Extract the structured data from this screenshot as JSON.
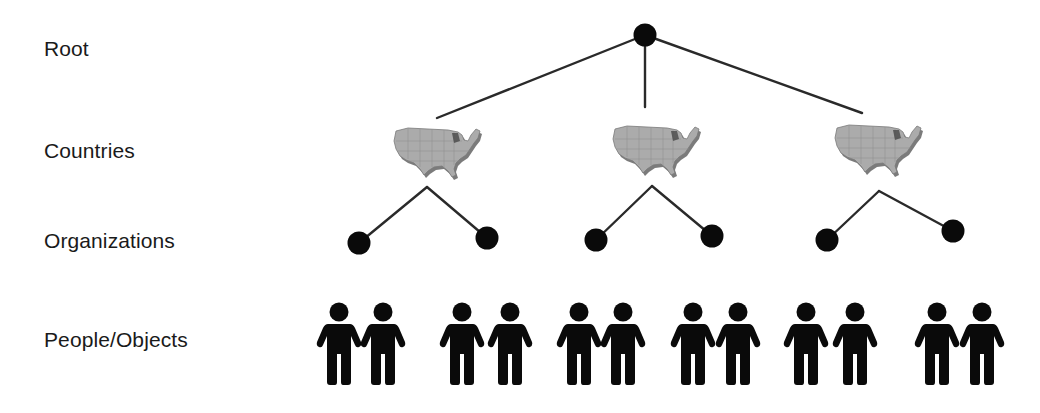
{
  "diagram": {
    "type": "hierarchy-tree",
    "levels": [
      {
        "label": "Root",
        "y": 50
      },
      {
        "label": "Countries",
        "y": 152
      },
      {
        "label": "Organizations",
        "y": 242
      },
      {
        "label": "People/Objects",
        "y": 341
      }
    ],
    "colors": {
      "node": "#0a0a0a",
      "edge": "#2a2a2a",
      "map_fill": "#a8a8a8",
      "map_shadow": "#555555",
      "label": "#1a1a1a"
    },
    "root": {
      "icon": "node-circle-icon",
      "x": 645,
      "y": 35
    },
    "countries": [
      {
        "icon": "us-map-icon",
        "x": 438,
        "y": 153,
        "apex": [
          427,
          187
        ],
        "root_edge_end": [
          437,
          118
        ],
        "organizations": [
          {
            "x": 359,
            "y": 243,
            "people_x": [
              339,
              383
            ]
          },
          {
            "x": 487,
            "y": 238,
            "people_x": [
              462,
              510
            ]
          }
        ]
      },
      {
        "icon": "us-map-icon",
        "x": 657,
        "y": 151,
        "apex": [
          652,
          186
        ],
        "root_edge_end": [
          645,
          107
        ],
        "organizations": [
          {
            "x": 596,
            "y": 240,
            "people_x": [
              579,
              623
            ]
          },
          {
            "x": 712,
            "y": 236,
            "people_x": [
              693,
              738
            ]
          }
        ]
      },
      {
        "icon": "us-map-icon",
        "x": 879,
        "y": 150,
        "apex": [
          879,
          191
        ],
        "root_edge_end": [
          862,
          113
        ],
        "organizations": [
          {
            "x": 827,
            "y": 240,
            "people_x": [
              806,
              855
            ]
          },
          {
            "x": 953,
            "y": 231,
            "people_x": [
              937,
              982
            ]
          }
        ]
      }
    ],
    "people_icon": "person-icon",
    "people_y": 302
  }
}
